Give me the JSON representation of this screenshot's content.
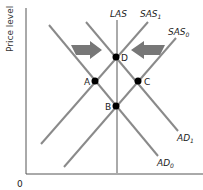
{
  "diagram": {
    "y_axis_label": "Price level",
    "origin_label": "0",
    "colors": {
      "axis": "#555555",
      "curve": "#8a8a8a",
      "las": "#aaaaaa",
      "arrow": "#777777",
      "point": "#000000"
    },
    "curves": [
      {
        "id": "LAS",
        "label": "LAS",
        "sub": ""
      },
      {
        "id": "SAS1",
        "label": "SAS",
        "sub": "1"
      },
      {
        "id": "SAS0",
        "label": "SAS",
        "sub": "0"
      },
      {
        "id": "AD1",
        "label": "AD",
        "sub": "1"
      },
      {
        "id": "AD0",
        "label": "AD",
        "sub": "0"
      }
    ],
    "points": [
      {
        "label": "D"
      },
      {
        "label": "A"
      },
      {
        "label": "C"
      },
      {
        "label": "B"
      }
    ],
    "arrows": [
      {
        "direction": "right"
      },
      {
        "direction": "left"
      }
    ]
  }
}
